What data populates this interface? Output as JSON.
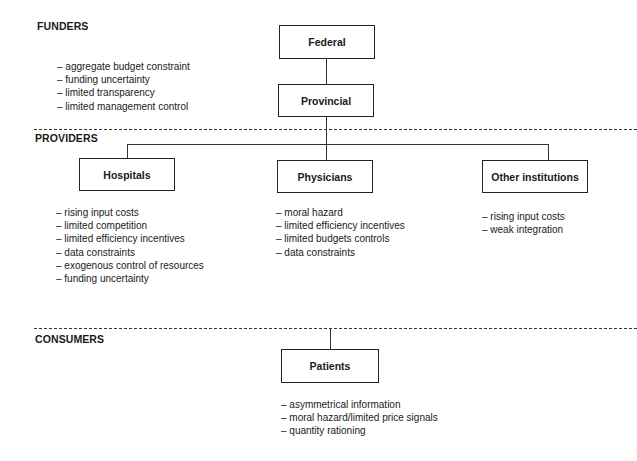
{
  "sections": {
    "funders": "FUNDERS",
    "providers": "PROVIDERS",
    "consumers": "CONSUMERS"
  },
  "nodes": {
    "federal": "Federal",
    "provincial": "Provincial",
    "hospitals": "Hospitals",
    "physicians": "Physicians",
    "other_institutions": "Other institutions",
    "patients": "Patients"
  },
  "issues": {
    "funders": [
      "– aggregate budget constraint",
      "– funding uncertainty",
      "– limited transparency",
      "– limited management control"
    ],
    "hospitals": [
      "– rising input costs",
      "– limited competition",
      "– limited efficiency incentives",
      "– data constraints",
      "– exogenous control of resources",
      "– funding uncertainty"
    ],
    "physicians": [
      "– moral hazard",
      "– limited efficiency incentives",
      "– limited budgets controls",
      "– data constraints"
    ],
    "other_institutions": [
      "– rising input costs",
      "– weak integration"
    ],
    "patients": [
      "– asymmetrical information",
      "– moral hazard/limited price signals",
      "– quantity rationing"
    ]
  }
}
